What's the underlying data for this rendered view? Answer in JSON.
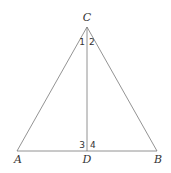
{
  "diagram": {
    "type": "geometry-triangle",
    "points": {
      "A": {
        "label": "A",
        "x": 17,
        "y": 151
      },
      "B": {
        "label": "B",
        "x": 157,
        "y": 151
      },
      "C": {
        "label": "C",
        "x": 87,
        "y": 27
      },
      "D": {
        "label": "D",
        "x": 87,
        "y": 151
      }
    },
    "segments": [
      "AC",
      "BC",
      "AB",
      "CD"
    ],
    "angle_labels": {
      "a1": "1",
      "a2": "2",
      "a3": "3",
      "a4": "4"
    },
    "colors": {
      "stroke": "#777777",
      "text": "#333333"
    }
  }
}
